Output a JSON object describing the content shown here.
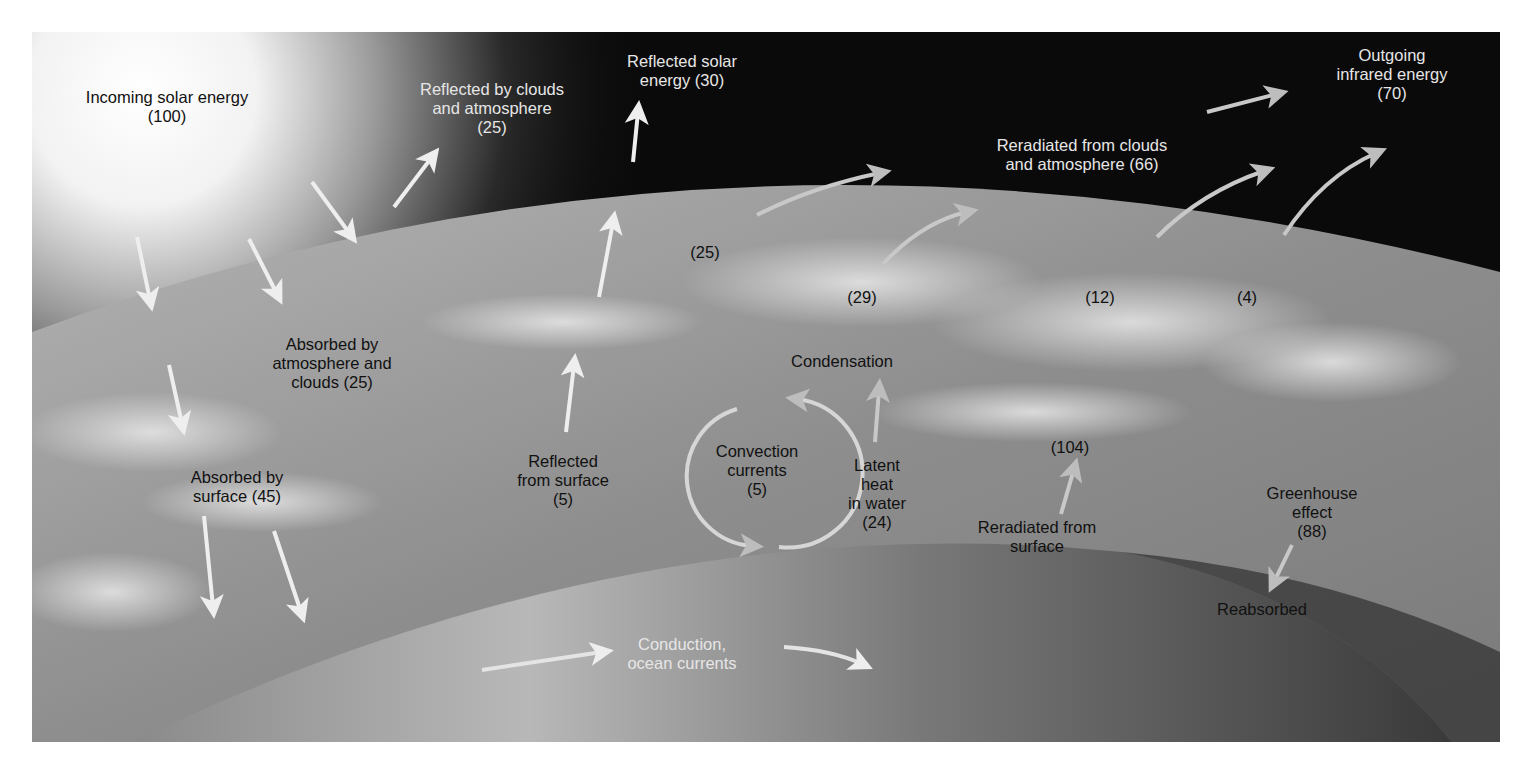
{
  "figure": {
    "colors": {
      "space": "#0a0a0a",
      "atmosphere": "#9a9a9a",
      "surface": "#7a7a7a",
      "sun_glow": "#f4f4f4",
      "arrow": "#eeeeee",
      "label_light": "#e6e6e6",
      "label_dark": "#111111"
    }
  },
  "labels": {
    "incoming": {
      "line1": "Incoming solar energy",
      "line2": "(100)"
    },
    "reflected_clouds": {
      "line1": "Reflected by clouds",
      "line2": "and atmosphere",
      "line3": "(25)"
    },
    "reflected_solar": {
      "line1": "Reflected solar",
      "line2": "energy (30)"
    },
    "outgoing_ir": {
      "line1": "Outgoing",
      "line2": "infrared energy",
      "line3": "(70)"
    },
    "reradiated_clouds": {
      "line1": "Reradiated from clouds",
      "line2": "and atmosphere (66)"
    },
    "value_25_atm": "(25)",
    "value_29": "(29)",
    "value_12": "(12)",
    "value_4": "(4)",
    "absorbed_atm": {
      "line1": "Absorbed by",
      "line2": "atmosphere and",
      "line3": "clouds (25)"
    },
    "condensation": "Condensation",
    "absorbed_surface": {
      "line1": "Absorbed by",
      "line2": "surface (45)"
    },
    "reflected_surface": {
      "line1": "Reflected",
      "line2": "from surface",
      "line3": "(5)"
    },
    "convection": {
      "line1": "Convection",
      "line2": "currents",
      "line3": "(5)"
    },
    "latent_heat": {
      "line1": "Latent",
      "line2": "heat",
      "line3": "in water",
      "line4": "(24)"
    },
    "value_104": "(104)",
    "reradiated_surface": {
      "line1": "Reradiated from",
      "line2": "surface"
    },
    "greenhouse": {
      "line1": "Greenhouse",
      "line2": "effect",
      "line3": "(88)"
    },
    "reabsorbed": "Reabsorbed",
    "conduction": {
      "line1": "Conduction,",
      "line2": "ocean currents"
    }
  }
}
